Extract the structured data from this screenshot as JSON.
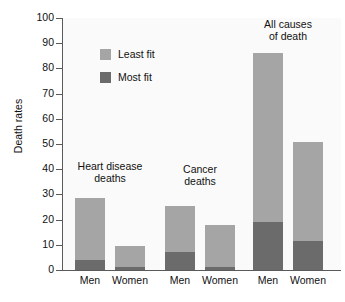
{
  "chart_data": {
    "type": "bar",
    "subtype": "stacked",
    "title": "",
    "xlabel": "",
    "ylabel": "Death rates",
    "ylim": [
      0,
      100
    ],
    "ytick_step": 10,
    "yticks": [
      0,
      10,
      20,
      30,
      40,
      50,
      60,
      70,
      80,
      90,
      100
    ],
    "ytick_labels": [
      "0",
      "10",
      "20",
      "30",
      "40",
      "50",
      "60",
      "70",
      "80",
      "90",
      "100"
    ],
    "grid": false,
    "legend_position": "upper-left-inside",
    "categories": [
      "Men",
      "Women",
      "Men",
      "Women",
      "Men",
      "Women"
    ],
    "series": [
      {
        "name": "Most fit",
        "color": "#6b6b6b",
        "values": [
          3.8,
          1.0,
          7.2,
          1.0,
          19.0,
          11.5
        ]
      },
      {
        "name": "Least fit",
        "color": "#a5a5a5",
        "values": [
          24.8,
          8.5,
          18.2,
          17.0,
          67.3,
          39.2
        ]
      }
    ],
    "totals": [
      28.6,
      9.5,
      25.4,
      18.0,
      86.3,
      50.7
    ],
    "groups": [
      {
        "annotation": "Heart disease\ndeaths",
        "categories": [
          "Men",
          "Women"
        ]
      },
      {
        "annotation": "Cancer\ndeaths",
        "categories": [
          "Men",
          "Women"
        ]
      },
      {
        "annotation": "All causes\nof death",
        "categories": [
          "Men",
          "Women"
        ]
      }
    ],
    "annotations": [
      "Heart disease deaths",
      "Cancer deaths",
      "All causes of death"
    ]
  },
  "axis": {
    "y_title": "Death rates"
  },
  "legend": {
    "items": [
      {
        "label": "Least fit",
        "color": "#a5a5a5"
      },
      {
        "label": "Most fit",
        "color": "#6b6b6b"
      }
    ]
  },
  "group_annotations": [
    {
      "text": "Heart disease\ndeaths"
    },
    {
      "text": "Cancer\ndeaths"
    },
    {
      "text": "All causes\nof death"
    }
  ],
  "x_labels": [
    "Men",
    "Women",
    "Men",
    "Women",
    "Men",
    "Women"
  ],
  "colors": {
    "least_fit": "#a5a5a5",
    "most_fit": "#6b6b6b",
    "axis": "#5a5a5a",
    "text": "#111111",
    "plot_background": "#fafafa",
    "page_background": "#ffffff"
  }
}
